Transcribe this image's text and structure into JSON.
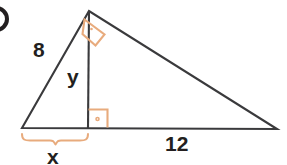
{
  "diagram": {
    "type": "geometry-figure",
    "canvas": {
      "width": 287,
      "height": 165
    },
    "colors": {
      "stroke": "#231f20",
      "label_text": "#231f20",
      "marker_orange": "#e8ab7d",
      "brace_orange": "#e8ab7d",
      "background": "#ffffff"
    },
    "labels": {
      "leg_left": "8",
      "altitude": "y",
      "base_right_segment": "12",
      "base_left_segment": "x"
    },
    "vertices": {
      "apex": {
        "x": 89,
        "y": 11
      },
      "bottom_left": {
        "x": 22,
        "y": 128
      },
      "bottom_right": {
        "x": 277,
        "y": 129
      },
      "altitude_foot": {
        "x": 88,
        "y": 128
      }
    },
    "markers": [
      {
        "name": "right-angle-apex",
        "kind": "right-angle-square-rotated",
        "at": {
          "x": 89,
          "y": 11
        },
        "has_dot": true
      },
      {
        "name": "right-angle-altitude-foot",
        "kind": "right-angle-square",
        "at": {
          "x": 88,
          "y": 128
        },
        "has_dot": true
      }
    ],
    "brace": {
      "name": "x-measure-brace",
      "from_x": 22,
      "to_x": 88,
      "y": 134,
      "label": "x"
    },
    "bullet": {
      "name": "problem-number-bullet",
      "visible": true,
      "cropped": true
    }
  }
}
